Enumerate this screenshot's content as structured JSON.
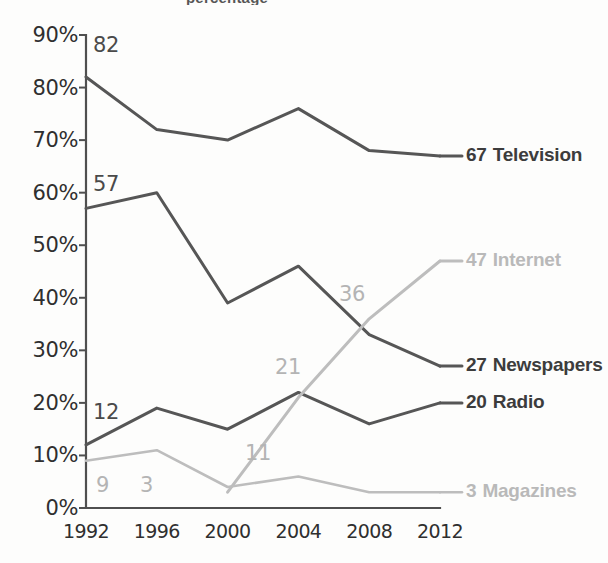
{
  "title_fragment": "percentage",
  "axes": {
    "y_ticks": [
      "0%",
      "10%",
      "20%",
      "30%",
      "40%",
      "50%",
      "60%",
      "70%",
      "80%",
      "90%"
    ],
    "x_ticks": [
      "1992",
      "1996",
      "2000",
      "2004",
      "2008",
      "2012"
    ]
  },
  "colors": {
    "dark_line": "#565656",
    "light_line": "#bdbdbd",
    "axis": "#4f4f4f",
    "dark_text": "#3c3c3c",
    "light_text": "#b9b9b9",
    "background": "#fdfdfc"
  },
  "series_labels": [
    {
      "value": "67",
      "name": "Television",
      "tone": "dark"
    },
    {
      "value": "47",
      "name": "Internet",
      "tone": "light"
    },
    {
      "value": "27",
      "name": "Newspapers",
      "tone": "dark"
    },
    {
      "value": "20",
      "name": "Radio",
      "tone": "dark"
    },
    {
      "value": "3",
      "name": "Magazines",
      "tone": "light"
    }
  ],
  "point_labels": [
    {
      "text": "82",
      "tone": "dark",
      "x": 93,
      "y": 33
    },
    {
      "text": "57",
      "tone": "dark",
      "x": 93,
      "y": 172
    },
    {
      "text": "12",
      "tone": "dark",
      "x": 93,
      "y": 400
    },
    {
      "text": "9",
      "tone": "light",
      "x": 96,
      "y": 473
    },
    {
      "text": "3",
      "tone": "light",
      "x": 140,
      "y": 473
    },
    {
      "text": "11",
      "tone": "light",
      "x": 245,
      "y": 441
    },
    {
      "text": "21",
      "tone": "light",
      "x": 275,
      "y": 355
    },
    {
      "text": "36",
      "tone": "light",
      "x": 339,
      "y": 282
    }
  ],
  "chart_data": {
    "type": "line",
    "title": "",
    "xlabel": "",
    "ylabel": "",
    "x": [
      1992,
      1996,
      2000,
      2004,
      2008,
      2012
    ],
    "ylim": [
      0,
      90
    ],
    "yticks": [
      0,
      10,
      20,
      30,
      40,
      50,
      60,
      70,
      80,
      90
    ],
    "ytick_format": "percent",
    "grid": false,
    "legend": "end-of-line labels",
    "series": [
      {
        "name": "Television",
        "color": "#565656",
        "width": 3.0,
        "values": [
          82,
          72,
          70,
          76,
          68,
          67
        ],
        "labeled_points": {
          "1992": 82,
          "2012": 67
        }
      },
      {
        "name": "Newspapers",
        "color": "#565656",
        "width": 3.0,
        "values": [
          57,
          60,
          39,
          46,
          33,
          27
        ],
        "labeled_points": {
          "1992": 57,
          "2012": 27
        }
      },
      {
        "name": "Radio",
        "color": "#565656",
        "width": 3.0,
        "values": [
          12,
          19,
          15,
          22,
          16,
          20
        ],
        "labeled_points": {
          "1992": 12,
          "2012": 20
        }
      },
      {
        "name": "Internet",
        "color": "#bdbdbd",
        "width": 3.0,
        "x": [
          2000,
          2004,
          2008,
          2012
        ],
        "values": [
          3,
          21,
          36,
          47
        ],
        "labeled_points": {
          "2000": 3,
          "2004": 21,
          "2008": 36,
          "2012": 47
        }
      },
      {
        "name": "Magazines",
        "color": "#bdbdbd",
        "width": 2.6,
        "values": [
          9,
          11,
          4,
          6,
          3,
          3
        ],
        "labeled_points": {
          "1992": 9,
          "2000": 11,
          "2012": 3
        }
      }
    ]
  }
}
